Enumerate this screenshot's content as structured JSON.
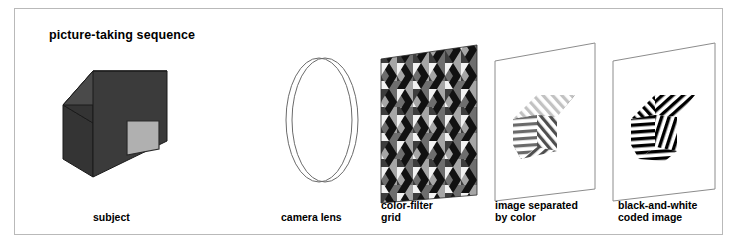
{
  "figure": {
    "title": "picture-taking sequence",
    "border_color": "#b9b9b9",
    "background": "#ffffff"
  },
  "stages": [
    {
      "id": "subject",
      "label": "subject",
      "icon": "house-3d-icon",
      "colors": {
        "roof": "#4a4a4a",
        "front_wall": "#3b3b3b",
        "side_wall": "#343434",
        "window": "#b0b0b0",
        "outline": "#1a1a1a"
      }
    },
    {
      "id": "camera-lens",
      "label": "camera lens",
      "icon": "lens-ellipse-icon",
      "colors": {
        "outline": "#6b6b6b",
        "fill": "#ffffff"
      }
    },
    {
      "id": "color-filter-grid",
      "label": "color-filter\ngrid",
      "icon": "hex-filter-grid-icon",
      "colors": {
        "black": "#111111",
        "dark_gray": "#3d3d3d",
        "mid_gray": "#6e6e6e",
        "light_gray": "#a6a6a6",
        "white": "#f2f2f2"
      }
    },
    {
      "id": "image-separated-by-color",
      "label": "image separated\nby color",
      "icon": "striped-house-sheet-icon",
      "colors": {
        "sheet_outline": "#8c8c8c",
        "sheet_fill": "#ffffff",
        "stripe_dark": "#4f4f4f",
        "stripe_mid": "#8a8a8a",
        "stripe_light": "#c2c2c2"
      }
    },
    {
      "id": "black-and-white-coded-image",
      "label": "black-and-white\ncoded image",
      "icon": "bw-striped-house-sheet-icon",
      "colors": {
        "sheet_outline": "#8c8c8c",
        "sheet_fill": "#ffffff",
        "stripe": "#000000"
      }
    }
  ]
}
